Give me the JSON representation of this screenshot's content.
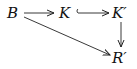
{
  "diagram": {
    "type": "commutative-diagram",
    "nodes": {
      "B": {
        "label": "B"
      },
      "K": {
        "label": "K"
      },
      "Kp": {
        "label": "K′"
      },
      "Rp": {
        "label": "R′"
      }
    },
    "edges": [
      {
        "from": "B",
        "to": "K",
        "style": "arrow"
      },
      {
        "from": "K",
        "to": "K′",
        "style": "hook-arrow (inclusion)"
      },
      {
        "from": "K′",
        "to": "R′",
        "style": "arrow"
      },
      {
        "from": "B",
        "to": "R′",
        "style": "arrow"
      }
    ]
  }
}
